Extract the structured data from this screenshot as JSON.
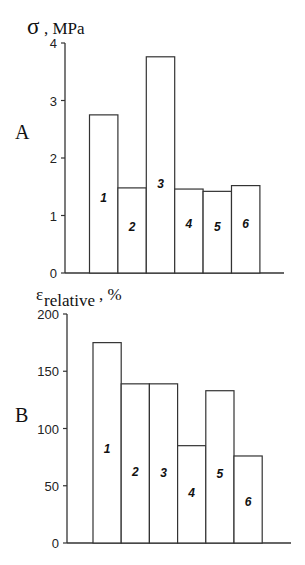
{
  "chart_data": [
    {
      "panel": "A",
      "type": "bar",
      "ylabel": "σ, MPa",
      "ylim": [
        0,
        4
      ],
      "yticks": [
        0,
        1,
        2,
        3,
        4
      ],
      "categories": [
        "1",
        "2",
        "3",
        "4",
        "5",
        "6"
      ],
      "values": [
        2.75,
        1.48,
        3.76,
        1.46,
        1.42,
        1.52
      ],
      "bar_label_y": [
        1.3,
        0.8,
        1.55,
        0.85,
        0.8,
        0.85
      ],
      "grid": false,
      "legend": null
    },
    {
      "panel": "B",
      "type": "bar",
      "ylabel": "ε_relative, %",
      "ylabel_main": "ε",
      "ylabel_sub": "relative",
      "ylabel_suffix": ", %",
      "ylim": [
        0,
        200
      ],
      "yticks": [
        0,
        50,
        100,
        150,
        200
      ],
      "categories": [
        "1",
        "2",
        "3",
        "4",
        "5",
        "6"
      ],
      "values": [
        175,
        139,
        139,
        85,
        133,
        76
      ],
      "bar_label_y": [
        82,
        62,
        61,
        44,
        60,
        36
      ],
      "grid": false,
      "legend": null
    }
  ],
  "panels": {
    "A": {
      "letter": "A",
      "ylabel": "σ, MPa"
    },
    "B": {
      "letter": "B",
      "ylabel_main": "ε",
      "ylabel_sub": "relative",
      "ylabel_suffix": ", %"
    }
  }
}
